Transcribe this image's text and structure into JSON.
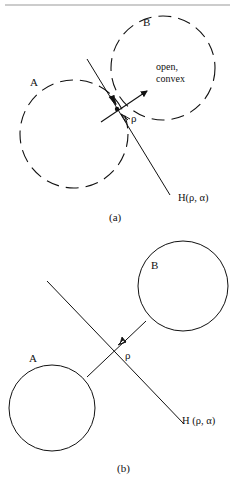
{
  "figure": {
    "top_rule_color": "#9a9a9a",
    "ink_color": "#111111"
  },
  "panel_a": {
    "caption": "(a)",
    "set_a_label": "A",
    "set_b_label": "B",
    "set_b_note_line1": "open,",
    "set_b_note_line2": "convex",
    "normal_label": "ρ",
    "hyperplane_label": "H(ρ, α)",
    "set_a_style": "dashed",
    "set_b_style": "dashed"
  },
  "panel_b": {
    "caption": "(b)",
    "set_a_label": "A",
    "set_b_label": "B",
    "normal_label": "ρ",
    "hyperplane_label": "H (ρ, α)",
    "set_a_style": "solid",
    "set_b_style": "solid"
  }
}
